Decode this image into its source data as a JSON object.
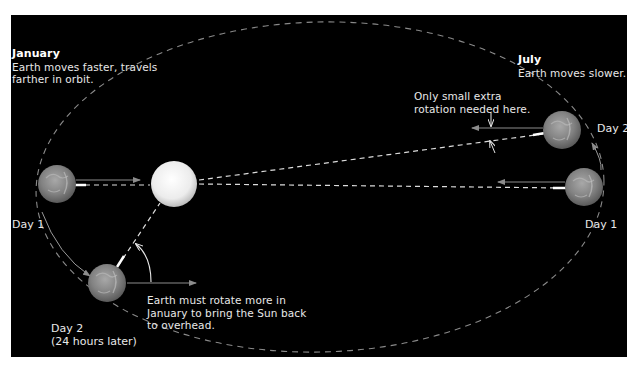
{
  "colors": {
    "background": "#000000",
    "frame": "#ffffff",
    "text": "#e8e8e8",
    "orbit": "#8a8a8a",
    "dash_line": "#dcdcdc",
    "arrow_gray": "#8c8c8c",
    "sun": "#f2f2f2",
    "earth": "#8a8a8a"
  },
  "january": {
    "title": "January",
    "line1": "Earth moves faster, travels",
    "line2": "farther in orbit."
  },
  "july": {
    "title": "July",
    "line1": "Earth moves slower."
  },
  "annotations": {
    "small_rotation_line1": "Only small extra",
    "small_rotation_line2": "rotation needed here.",
    "more_rotation_line1": "Earth must rotate more in",
    "more_rotation_line2": "January to bring the Sun back",
    "more_rotation_line3": "to overhead."
  },
  "labels": {
    "jan_day1": "Day 1",
    "jan_day2_line1": "Day 2",
    "jan_day2_line2": "(24 hours later)",
    "jul_day1": "Day 1",
    "jul_day2": "Day 2"
  },
  "objects": {
    "sun": "sun",
    "earth_jan_day1": "earth",
    "earth_jan_day2": "earth",
    "earth_jul_day1": "earth",
    "earth_jul_day2": "earth"
  }
}
